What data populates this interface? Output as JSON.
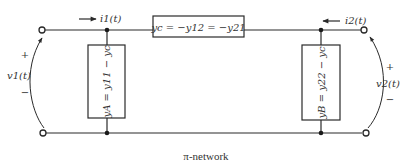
{
  "diagram": {
    "type": "circuit",
    "title": "π-network",
    "caption": "π-network",
    "elements": {
      "series_admittance": {
        "label": "yc = −y12 = −y21"
      },
      "left_shunt": {
        "label": "yA = y11 − yc"
      },
      "right_shunt": {
        "label": "yB = y22 − yc"
      }
    },
    "port1": {
      "current": "i1(t)",
      "voltage": "v1(t)",
      "plus": "+",
      "minus": "−"
    },
    "port2": {
      "current": "i2(t)",
      "voltage": "v2(t)",
      "plus": "+",
      "minus": "−"
    }
  }
}
